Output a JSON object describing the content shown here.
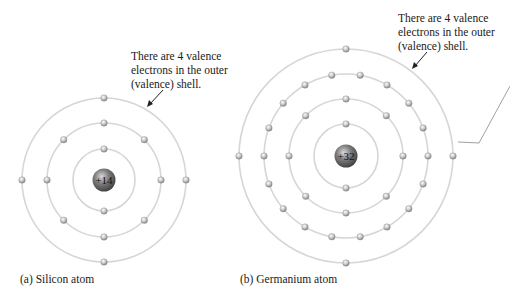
{
  "atoms": [
    {
      "id": "silicon",
      "caption": "(a) Silicon atom",
      "nucleus_label": "+14",
      "center": [
        104,
        180
      ],
      "shells": [
        {
          "radius": 31,
          "electrons": 2,
          "offset_deg": 0
        },
        {
          "radius": 57,
          "electrons": 8,
          "offset_deg": 0
        },
        {
          "radius": 82,
          "electrons": 4,
          "offset_deg": 0
        }
      ],
      "annotation": [
        "There are 4 valence",
        "electrons in the outer",
        "(valence) shell."
      ]
    },
    {
      "id": "germanium",
      "caption": "(b) Germanium atom",
      "nucleus_label": "+32",
      "center": [
        346,
        156
      ],
      "shells": [
        {
          "radius": 32,
          "electrons": 2,
          "offset_deg": 0
        },
        {
          "radius": 57,
          "electrons": 8,
          "offset_deg": 0
        },
        {
          "radius": 82,
          "electrons": 18,
          "offset_deg": 10
        },
        {
          "radius": 107,
          "electrons": 4,
          "offset_deg": 0
        }
      ],
      "annotation": [
        "There are 4 valence",
        "electrons in the outer",
        "(valence) shell."
      ]
    }
  ],
  "colors": {
    "shell": "#d6d6d6",
    "electron": "#b8b8b8",
    "nucleus": "#6a6a6a",
    "text": "#1a1a1a"
  }
}
